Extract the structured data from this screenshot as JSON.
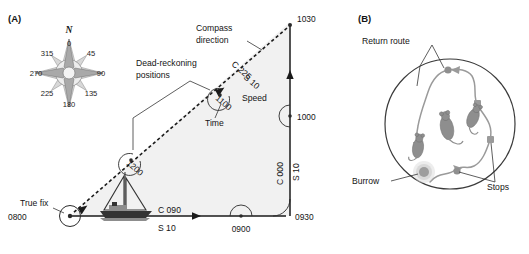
{
  "figure": {
    "panel_a": {
      "label": "(A)",
      "compass_rose": {
        "north_label": "N",
        "bearings": [
          "0",
          "45",
          "90",
          "135",
          "180",
          "225",
          "270",
          "315"
        ]
      },
      "annotations": {
        "compass_direction": "Compass\ndirection",
        "compass_direction_line1": "Compass",
        "compass_direction_line2": "direction",
        "dead_reckoning_line1": "Dead-reckoning",
        "dead_reckoning_line2": "positions",
        "speed": "Speed",
        "time": "Time",
        "true_fix": "True fix"
      },
      "waypoints": [
        {
          "name": "true-fix",
          "time": "0800"
        },
        {
          "name": "leg1-midpoint",
          "time": "0900"
        },
        {
          "name": "corner",
          "time": "0930"
        },
        {
          "name": "leg2-midpoint",
          "time": "1000"
        },
        {
          "name": "apex",
          "time": "1030"
        },
        {
          "name": "return-leg-upper",
          "time": "1100"
        },
        {
          "name": "return-leg-lower",
          "time": "1200"
        }
      ],
      "legs": [
        {
          "name": "outbound-east",
          "course": "C 090",
          "speed": "S 10"
        },
        {
          "name": "northbound",
          "course": "C 000",
          "speed": "S 10"
        },
        {
          "name": "return-southwest",
          "course": "C 225",
          "speed": "S 10"
        }
      ]
    },
    "panel_b": {
      "label": "(B)",
      "annotations": {
        "return_route": "Return route",
        "burrow": "Burrow",
        "stops": "Stops"
      }
    }
  },
  "colors": {
    "ink": "#1a1a1a",
    "triangle_fill": "#f1f1f1",
    "route_gray": "#9a9a9a",
    "mouse_gray": "#8e8e8e"
  }
}
